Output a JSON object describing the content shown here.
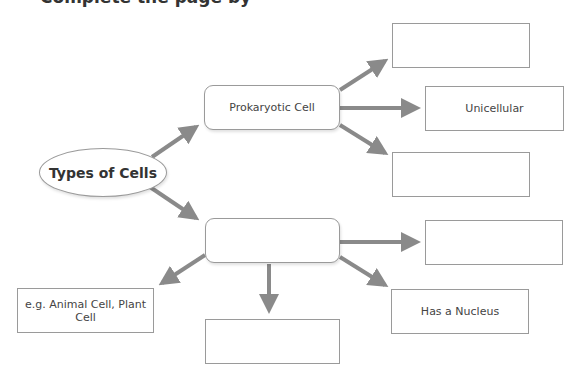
{
  "header": {
    "partial_title": "Complete the page by"
  },
  "diagram": {
    "root": {
      "label": "Types of Cells"
    },
    "branches": {
      "prokaryotic": {
        "label": "Prokaryotic Cell",
        "children": [
          {
            "label": ""
          },
          {
            "label": "Unicellular"
          },
          {
            "label": ""
          }
        ]
      },
      "eukaryotic": {
        "label": "",
        "children": [
          {
            "label": "e.g. Animal Cell, Plant Cell"
          },
          {
            "label": ""
          },
          {
            "label": ""
          },
          {
            "label": "Has a Nucleus"
          }
        ]
      }
    },
    "colors": {
      "arrow": "#8a8a8a",
      "border": "#9a9a9a",
      "background": "#ffffff"
    }
  }
}
